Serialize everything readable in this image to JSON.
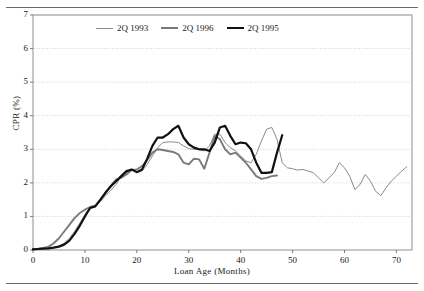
{
  "figure": {
    "top_rule": "horizontal-rule",
    "bottom_rule": "horizontal-rule"
  },
  "axes": {
    "xlabel": "Loan Age (Months)",
    "ylabel": "CPR (%)",
    "yticks": [
      "0",
      "1",
      "2",
      "3",
      "4",
      "5",
      "6",
      "7"
    ],
    "xticks": [
      "0",
      "10",
      "20",
      "30",
      "40",
      "50",
      "60",
      "70"
    ]
  },
  "legend": {
    "position": "top-center-inside",
    "entries": [
      {
        "label": "2Q 1993",
        "color": "#8a8a8a",
        "width": 1.0
      },
      {
        "label": "2Q 1996",
        "color": "#7a7a7a",
        "width": 1.9
      },
      {
        "label": "2Q 1995",
        "color": "#111111",
        "width": 2.2
      }
    ]
  },
  "chart_data": {
    "type": "line",
    "title": "",
    "xlabel": "Loan Age (Months)",
    "ylabel": "CPR (%)",
    "xlim": [
      0,
      73
    ],
    "ylim": [
      0,
      7
    ],
    "grid": "horizontal-dotted",
    "xtick_interval": 10,
    "ytick_interval": 1,
    "series": [
      {
        "name": "2Q 1993",
        "color": "#8a8a8a",
        "x": [
          0,
          1,
          2,
          3,
          4,
          5,
          6,
          7,
          8,
          9,
          10,
          11,
          12,
          13,
          14,
          15,
          16,
          17,
          18,
          19,
          20,
          21,
          22,
          23,
          24,
          25,
          26,
          27,
          28,
          29,
          30,
          31,
          32,
          33,
          34,
          35,
          36,
          37,
          38,
          39,
          40,
          41,
          42,
          43,
          44,
          45,
          46,
          47,
          48,
          49,
          50,
          51,
          52,
          53,
          54,
          55,
          56,
          57,
          58,
          59,
          60,
          61,
          62,
          63,
          64,
          65,
          66,
          67,
          68,
          69,
          70,
          71,
          72
        ],
        "y": [
          0.03,
          0.04,
          0.05,
          0.06,
          0.08,
          0.12,
          0.2,
          0.35,
          0.55,
          0.8,
          1.05,
          1.28,
          1.3,
          1.45,
          1.62,
          1.78,
          1.95,
          2.2,
          2.3,
          2.4,
          2.3,
          2.35,
          2.55,
          2.8,
          3.05,
          3.2,
          3.22,
          3.22,
          3.2,
          3.1,
          3.02,
          3.0,
          3.0,
          2.95,
          3.1,
          3.45,
          3.45,
          3.2,
          3.05,
          2.95,
          2.8,
          2.65,
          2.6,
          2.85,
          3.25,
          3.6,
          3.65,
          3.3,
          2.6,
          2.45,
          2.42,
          2.38,
          2.4,
          2.35,
          2.3,
          2.15,
          2.0,
          2.15,
          2.3,
          2.6,
          2.45,
          2.2,
          1.8,
          1.95,
          2.25,
          2.05,
          1.75,
          1.62,
          1.85,
          2.05,
          2.2,
          2.35,
          2.48
        ]
      },
      {
        "name": "2Q 1996",
        "color": "#7a7a7a",
        "x": [
          0,
          1,
          2,
          3,
          4,
          5,
          6,
          7,
          8,
          9,
          10,
          11,
          12,
          13,
          14,
          15,
          16,
          17,
          18,
          19,
          20,
          21,
          22,
          23,
          24,
          25,
          26,
          27,
          28,
          29,
          30,
          31,
          32,
          33,
          34,
          35,
          36,
          37,
          38,
          39,
          40,
          41,
          42,
          43,
          44,
          45,
          46,
          47
        ],
        "y": [
          0.03,
          0.04,
          0.06,
          0.1,
          0.2,
          0.35,
          0.55,
          0.75,
          0.95,
          1.1,
          1.2,
          1.28,
          1.32,
          1.5,
          1.7,
          1.92,
          2.1,
          2.15,
          2.25,
          2.38,
          2.4,
          2.5,
          2.68,
          2.9,
          3.0,
          2.98,
          2.95,
          2.92,
          2.85,
          2.6,
          2.55,
          2.72,
          2.7,
          2.42,
          2.9,
          3.4,
          3.3,
          3.0,
          2.85,
          2.9,
          2.75,
          2.6,
          2.4,
          2.2,
          2.12,
          2.15,
          2.2,
          2.22
        ]
      },
      {
        "name": "2Q 1995",
        "color": "#111111",
        "x": [
          0,
          1,
          2,
          3,
          4,
          5,
          6,
          7,
          8,
          9,
          10,
          11,
          12,
          13,
          14,
          15,
          16,
          17,
          18,
          19,
          20,
          21,
          22,
          23,
          24,
          25,
          26,
          27,
          28,
          29,
          30,
          31,
          32,
          33,
          34,
          35,
          36,
          37,
          38,
          39,
          40,
          41,
          42,
          43,
          44,
          45,
          46,
          47,
          48
        ],
        "y": [
          0.02,
          0.03,
          0.04,
          0.05,
          0.07,
          0.1,
          0.16,
          0.28,
          0.48,
          0.72,
          1.0,
          1.25,
          1.3,
          1.5,
          1.72,
          1.9,
          2.05,
          2.2,
          2.35,
          2.4,
          2.32,
          2.4,
          2.72,
          3.1,
          3.35,
          3.35,
          3.45,
          3.6,
          3.7,
          3.35,
          3.15,
          3.05,
          3.0,
          3.0,
          2.95,
          3.2,
          3.65,
          3.7,
          3.4,
          3.15,
          3.2,
          3.18,
          3.0,
          2.6,
          2.3,
          2.3,
          2.32,
          2.9,
          3.42
        ]
      }
    ]
  }
}
